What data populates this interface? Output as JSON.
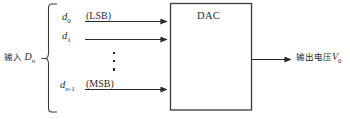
{
  "diagram": {
    "input_group_label": {
      "cjk": "输入",
      "symbol": "D",
      "symbol_sub": "n"
    },
    "inputs": [
      {
        "symbol": "d",
        "subscript": "0",
        "note": "(LSB)"
      },
      {
        "symbol": "d",
        "subscript": "1",
        "note": ""
      },
      {
        "symbol": "d",
        "subscript": "n-1",
        "note": "(MSB)"
      }
    ],
    "ellipsis": "⋮",
    "block": {
      "label": "DAC"
    },
    "output_label": {
      "cjk": "输出电压",
      "symbol": "V",
      "symbol_sub": "0"
    },
    "colors": {
      "stroke": "#3a3a3a",
      "text": "#2a2a2a",
      "background": "#ffffff"
    }
  }
}
